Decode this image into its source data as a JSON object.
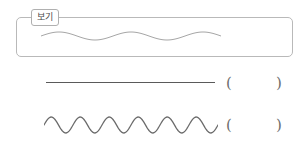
{
  "page": {
    "kind": "worksheet-question",
    "background_color": "#ffffff",
    "width": 308,
    "height": 145
  },
  "example_box": {
    "label": "보기",
    "border_color": "#b9b9b9",
    "figure": {
      "name": "low-frequency-wave",
      "stroke_color": "#a6a6a6",
      "stroke_width": 1,
      "cycles": 2.5,
      "amplitude": 4,
      "wavelength": 72
    }
  },
  "answer_rows": [
    {
      "id": "straight-line",
      "figure": {
        "name": "straight-line",
        "stroke_color": "#5a5a5a",
        "stroke_width": 1.4,
        "length": 169,
        "cycles": 0,
        "amplitude": 0
      },
      "blank": {
        "open_paren": "(",
        "close_paren": ")",
        "value": ""
      }
    },
    {
      "id": "high-frequency-wave",
      "figure": {
        "name": "high-frequency-wave",
        "stroke_color": "#6b6b6b",
        "stroke_width": 1.3,
        "cycles": 6,
        "amplitude": 8,
        "wavelength": 28
      },
      "blank": {
        "open_paren": "(",
        "close_paren": ")",
        "value": ""
      }
    }
  ]
}
